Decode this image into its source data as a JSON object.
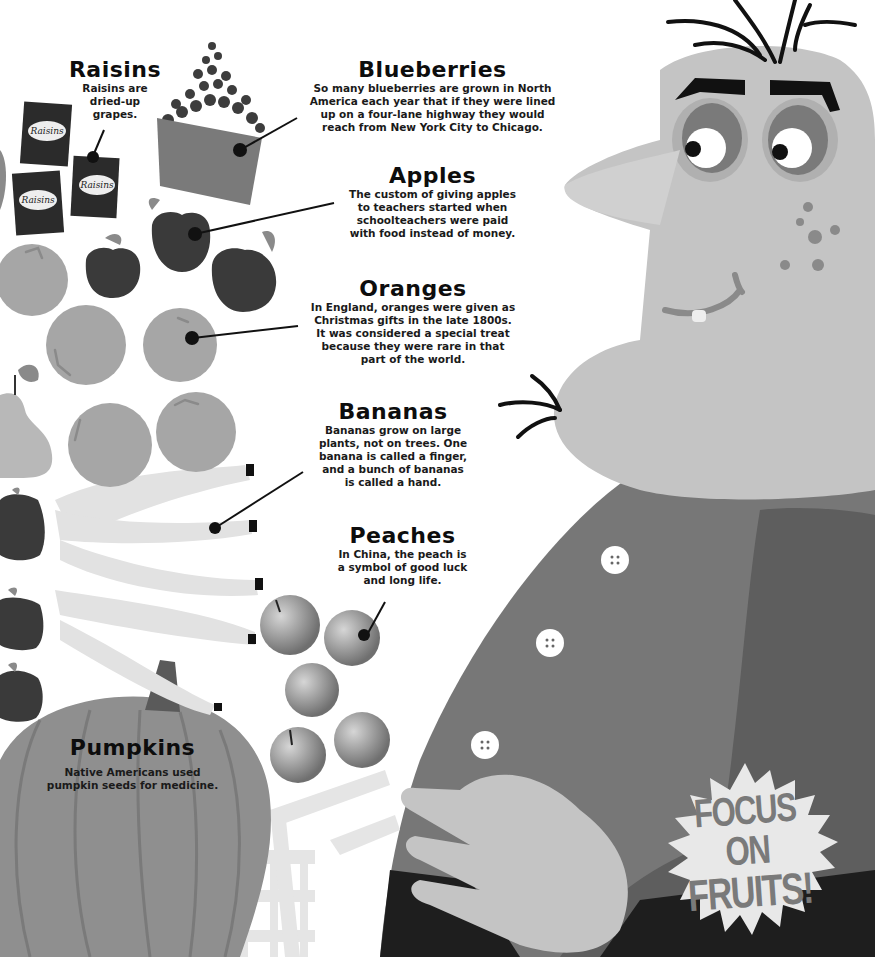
{
  "page": {
    "theme": "grayscale",
    "colors": {
      "background": "#ffffff",
      "text": "#111111",
      "character_skin": "#c4c4c4",
      "shirt": "#777777",
      "vest": "#5e5e5e",
      "pants": "#1e1e1e",
      "pumpkin": "#8f8f8f",
      "apple": "#3a3a3a",
      "orange": "#a6a6a6",
      "banana": "#e2e2e2",
      "blueberry": "#3d3d3d",
      "raisin_box": "#2b2b2b"
    }
  },
  "callouts": {
    "raisins": {
      "title": "Raisins",
      "lines": [
        "Raisins are",
        "dried-up",
        "grapes."
      ]
    },
    "blueberries": {
      "title": "Blueberries",
      "lines": [
        "So many blueberries are grown in North",
        "America each year that if they were lined",
        "up on a four-lane highway they would",
        "reach from New York City to Chicago."
      ]
    },
    "apples": {
      "title": "Apples",
      "lines": [
        "The custom of giving apples",
        "to teachers started when",
        "schoolteachers were paid",
        "with food instead of money."
      ]
    },
    "oranges": {
      "title": "Oranges",
      "lines": [
        "In England, oranges were given as",
        "Christmas gifts in the late 1800s.",
        "It was considered a special treat",
        "because they were rare in that",
        "part of the world."
      ]
    },
    "bananas": {
      "title": "Bananas",
      "lines": [
        "Bananas grow on large",
        "plants, not on trees. One",
        "banana is called a finger,",
        "and a bunch of bananas",
        "is called a hand."
      ]
    },
    "peaches": {
      "title": "Peaches",
      "lines": [
        "In China, the peach is",
        "a symbol of good luck",
        "and long life."
      ]
    },
    "pumpkins": {
      "title": "Pumpkins",
      "lines": [
        "Native Americans used",
        "pumpkin seeds for medicine."
      ]
    }
  },
  "labels": {
    "raisin_box": "Raisins"
  },
  "starburst": {
    "line1": "FOCUS ON",
    "line2": "FRUITS!"
  }
}
